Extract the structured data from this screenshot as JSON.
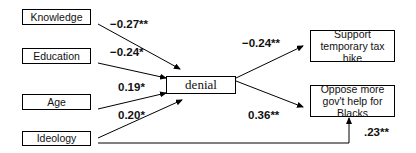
{
  "diagram": {
    "predictors": [
      {
        "label": "Knowledge",
        "coef": "−0.27**"
      },
      {
        "label": "Education",
        "coef": "−0.24*"
      },
      {
        "label": "Age",
        "coef": "0.19*"
      },
      {
        "label": "Ideology",
        "coef": "0.20*"
      }
    ],
    "mediator": {
      "label": "denial"
    },
    "outcomes": [
      {
        "label": "Support temporary tax hike",
        "coef": "−0.24**"
      },
      {
        "label": "Oppose more gov't help for Blacks",
        "coef": "0.36**"
      }
    ],
    "direct_path": {
      "from": "Ideology",
      "to": "Oppose more gov't help for Blacks",
      "coef": ".23**"
    }
  }
}
